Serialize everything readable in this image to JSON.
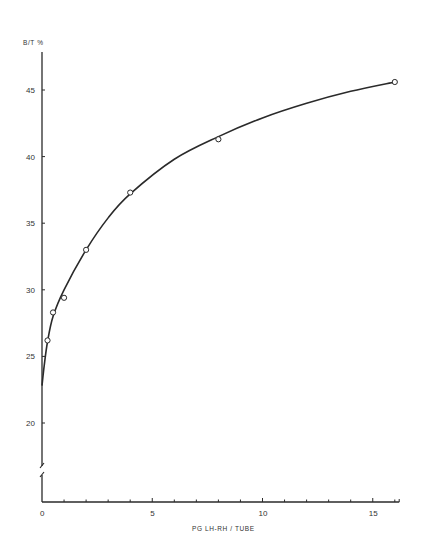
{
  "chart_data": {
    "type": "line",
    "title": "",
    "xlabel": "PG LH-RH / TUBE",
    "ylabel": "B/T %",
    "xlim": [
      0,
      16
    ],
    "ylim": [
      15,
      47
    ],
    "y_axis_break": true,
    "grid": false,
    "legend": null,
    "x_ticks": [
      0,
      5,
      10,
      15
    ],
    "x_tick_labels": [
      "0",
      "5",
      "10",
      "15"
    ],
    "x_minor_tick_step": 1,
    "y_ticks": [
      20,
      25,
      30,
      35,
      40,
      45
    ],
    "y_tick_labels": [
      "20",
      "25",
      "30",
      "35",
      "40",
      "45"
    ],
    "series": [
      {
        "name": "B/T %",
        "marker": "open-circle",
        "x": [
          0.25,
          0.5,
          1,
          2,
          4,
          8,
          16
        ],
        "y": [
          26.2,
          28.3,
          29.4,
          33.0,
          37.3,
          41.3,
          45.6
        ]
      }
    ],
    "fit_curve": {
      "x": [
        0,
        0.1,
        0.25,
        0.5,
        1,
        2,
        3,
        4,
        6,
        8,
        10,
        12,
        14,
        16
      ],
      "y": [
        22.8,
        24.3,
        26.1,
        28.0,
        30.0,
        33.0,
        35.4,
        37.2,
        39.8,
        41.5,
        42.9,
        44.0,
        44.9,
        45.6
      ]
    }
  }
}
